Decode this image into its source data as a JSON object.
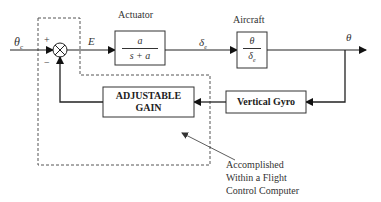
{
  "diagram": {
    "type": "control-loop block diagram",
    "input": {
      "symbol": "θ",
      "subscript": "c"
    },
    "summing_junction": {
      "plus_sign": "+",
      "minus_sign": "−"
    },
    "error_signal": "E",
    "actuator": {
      "title": "Actuator",
      "numerator": "a",
      "denominator": "s + a"
    },
    "actuator_output": {
      "symbol": "δ",
      "subscript": "e"
    },
    "aircraft": {
      "title": "Aircraft",
      "numerator": "θ",
      "denominator_symbol": "δ",
      "denominator_subscript": "e"
    },
    "output": {
      "symbol": "θ"
    },
    "vertical_gyro": {
      "label": "Vertical Gyro"
    },
    "adjustable_gain": {
      "line1": "ADJUSTABLE",
      "line2": "GAIN"
    },
    "annotation": {
      "line1": "Accomplished",
      "line2": "Within a Flight",
      "line3": "Control Computer"
    },
    "colors": {
      "stroke": "#222222",
      "dashed": "#555555",
      "text": "#333333"
    }
  }
}
